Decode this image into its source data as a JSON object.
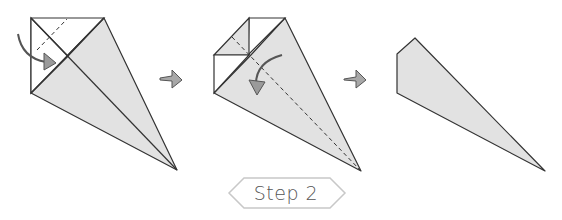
{
  "diagram": {
    "title": "Step 2",
    "colors": {
      "paper_shaded": "#e2e2e2",
      "paper_white": "#ffffff",
      "line": "#333333",
      "arrow_fill": "#9a9a9a",
      "arrow_stroke": "#555555",
      "label_border": "#c8c8c8",
      "label_text": "#555555"
    },
    "figures": [
      {
        "id": "fig-1",
        "description": "Kite base with top-left corner flap; valley fold along dashed line, arrow folding corner down-right"
      },
      {
        "id": "fig-2",
        "description": "Corner folded; dashed line along center diagonal, curved arrow folding in half"
      },
      {
        "id": "fig-3",
        "description": "Result: narrow folded shape"
      }
    ],
    "connectors": [
      "right-arrow-1",
      "right-arrow-2"
    ]
  }
}
